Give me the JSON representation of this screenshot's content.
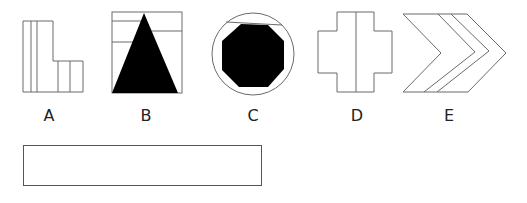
{
  "figures": [
    {
      "id": "A",
      "label": "A",
      "description": "L-shaped outline with vertical dividing lines"
    },
    {
      "id": "B",
      "label": "B",
      "description": "Square with black filled triangle and horizontal lines"
    },
    {
      "id": "C",
      "label": "C",
      "description": "Circle containing black filled octagon with top chord line"
    },
    {
      "id": "D",
      "label": "D",
      "description": "Cross shape with central vertical line"
    },
    {
      "id": "E",
      "label": "E",
      "description": "Nested chevron arrow shapes"
    }
  ],
  "answer_box": {
    "value": ""
  },
  "colors": {
    "stroke": "#6b6b6b",
    "fill": "#000000",
    "background": "#ffffff"
  }
}
